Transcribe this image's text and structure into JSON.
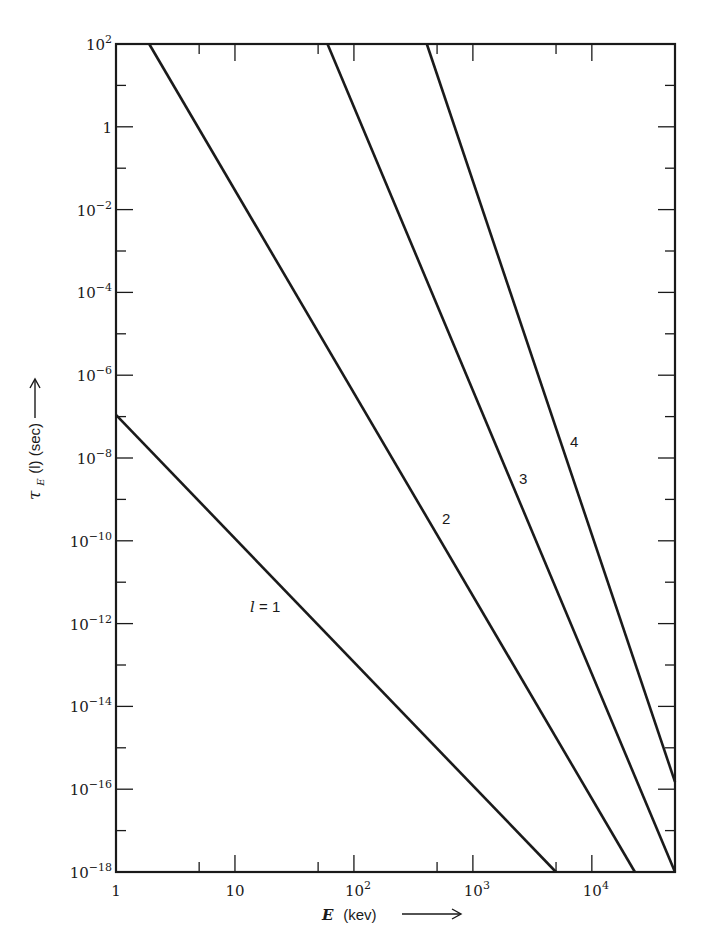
{
  "chart_data": {
    "type": "line",
    "title": "",
    "xlabel": "E (kev)",
    "ylabel": "τ_E(l) (sec)",
    "xscale": "log",
    "yscale": "log",
    "xlim": [
      1,
      50000
    ],
    "ylim": [
      1e-18,
      100
    ],
    "grid": false,
    "legend": "inline curve labels",
    "x_tick_labels": [
      "1",
      "10",
      "10^2",
      "10^3",
      "10^4"
    ],
    "x_tick_values": [
      1,
      10,
      100,
      1000,
      10000
    ],
    "y_tick_labels": [
      "10^2",
      "1",
      "10^-2",
      "10^-4",
      "10^-6",
      "10^-8",
      "10^-10",
      "10^-12",
      "10^-14",
      "10^-16",
      "10^-18"
    ],
    "y_tick_values": [
      100,
      1,
      0.01,
      0.0001,
      1e-06,
      1e-08,
      1e-10,
      1e-12,
      1e-14,
      1e-16,
      1e-18
    ],
    "series": [
      {
        "name": "l = 1",
        "label": "l = 1",
        "x": [
          1,
          5000
        ],
        "y": [
          1.1e-07,
          1e-18
        ],
        "label_pos": [
          250,
          612
        ]
      },
      {
        "name": "2",
        "label": "2",
        "x": [
          1.9,
          23000
        ],
        "y": [
          100,
          1e-18
        ],
        "label_pos": [
          442,
          524
        ]
      },
      {
        "name": "3",
        "label": "3",
        "x": [
          60,
          50000
        ],
        "y": [
          100,
          1e-18
        ],
        "label_pos": [
          519,
          484
        ]
      },
      {
        "name": "4",
        "label": "4",
        "x": [
          410,
          50000
        ],
        "y": [
          100,
          1.5e-16
        ],
        "label_pos": [
          570,
          447
        ]
      }
    ]
  },
  "axes": {
    "x_title_var": "E",
    "x_title_unit": "(kev)",
    "y_title_var": "τ",
    "y_title_sub": "E",
    "y_title_rest": "(l) (sec)"
  }
}
